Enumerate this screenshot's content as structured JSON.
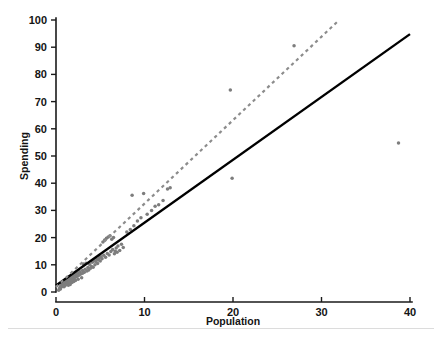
{
  "chart_data": {
    "type": "scatter",
    "title": "",
    "xlabel": "Population",
    "ylabel": "Spending",
    "xlim": [
      0,
      40
    ],
    "ylim": [
      0,
      100
    ],
    "xticks": [
      0,
      10,
      20,
      30,
      40
    ],
    "yticks": [
      0,
      10,
      20,
      30,
      40,
      50,
      60,
      70,
      80,
      90,
      100
    ],
    "grid": false,
    "legend": "none",
    "point_color": "#7d7d7d",
    "series": [
      {
        "name": "observations",
        "type": "scatter",
        "marker": "circle",
        "color": "#7d7d7d",
        "points": [
          [
            0.3,
            0.6
          ],
          [
            0.4,
            1.4
          ],
          [
            0.5,
            2.0
          ],
          [
            0.5,
            1.1
          ],
          [
            0.6,
            2.6
          ],
          [
            0.6,
            1.8
          ],
          [
            0.7,
            2.2
          ],
          [
            0.7,
            3.1
          ],
          [
            0.8,
            2.4
          ],
          [
            0.8,
            3.4
          ],
          [
            0.9,
            2.9
          ],
          [
            0.9,
            1.9
          ],
          [
            1.0,
            3.3
          ],
          [
            1.0,
            2.3
          ],
          [
            1.1,
            3.8
          ],
          [
            1.1,
            2.7
          ],
          [
            1.2,
            4.0
          ],
          [
            1.2,
            3.0
          ],
          [
            1.3,
            4.4
          ],
          [
            1.3,
            3.3
          ],
          [
            1.4,
            2.5
          ],
          [
            1.4,
            4.6
          ],
          [
            1.5,
            3.6
          ],
          [
            1.5,
            5.0
          ],
          [
            1.6,
            4.1
          ],
          [
            1.6,
            2.8
          ],
          [
            1.7,
            5.3
          ],
          [
            1.7,
            4.3
          ],
          [
            1.8,
            3.5
          ],
          [
            1.8,
            5.6
          ],
          [
            1.9,
            4.6
          ],
          [
            1.9,
            6.0
          ],
          [
            2.0,
            5.0
          ],
          [
            2.0,
            3.9
          ],
          [
            2.1,
            6.3
          ],
          [
            2.2,
            5.4
          ],
          [
            2.2,
            4.2
          ],
          [
            2.3,
            6.7
          ],
          [
            2.4,
            5.8
          ],
          [
            2.5,
            7.0
          ],
          [
            2.5,
            4.7
          ],
          [
            2.6,
            6.2
          ],
          [
            2.7,
            7.4
          ],
          [
            2.8,
            6.6
          ],
          [
            2.9,
            5.2
          ],
          [
            3.0,
            7.9
          ],
          [
            3.0,
            6.9
          ],
          [
            3.1,
            10.3
          ],
          [
            3.2,
            7.3
          ],
          [
            3.3,
            8.4
          ],
          [
            3.4,
            10.6
          ],
          [
            3.5,
            7.7
          ],
          [
            3.6,
            9.0
          ],
          [
            3.7,
            8.1
          ],
          [
            3.8,
            10.1
          ],
          [
            3.9,
            8.7
          ],
          [
            4.0,
            9.4
          ],
          [
            4.1,
            10.9
          ],
          [
            4.2,
            9.1
          ],
          [
            4.3,
            11.5
          ],
          [
            4.4,
            10.0
          ],
          [
            4.5,
            11.2
          ],
          [
            4.6,
            12.1
          ],
          [
            4.7,
            10.5
          ],
          [
            4.8,
            11.8
          ],
          [
            4.9,
            12.6
          ],
          [
            5.0,
            11.4
          ],
          [
            5.1,
            13.0
          ],
          [
            5.2,
            12.2
          ],
          [
            5.3,
            18.4
          ],
          [
            5.4,
            13.5
          ],
          [
            5.5,
            19.1
          ],
          [
            5.6,
            12.8
          ],
          [
            5.7,
            19.8
          ],
          [
            5.8,
            14.2
          ],
          [
            5.9,
            20.2
          ],
          [
            6.0,
            13.6
          ],
          [
            6.1,
            20.7
          ],
          [
            6.2,
            14.9
          ],
          [
            6.3,
            19.4
          ],
          [
            6.4,
            15.6
          ],
          [
            6.5,
            20.0
          ],
          [
            6.6,
            14.1
          ],
          [
            6.7,
            15.0
          ],
          [
            6.8,
            16.2
          ],
          [
            6.9,
            14.6
          ],
          [
            7.0,
            16.9
          ],
          [
            7.2,
            15.3
          ],
          [
            7.4,
            17.6
          ],
          [
            7.6,
            16.4
          ],
          [
            8.0,
            22.1
          ],
          [
            8.4,
            23.0
          ],
          [
            8.6,
            35.6
          ],
          [
            8.8,
            24.4
          ],
          [
            9.2,
            26.1
          ],
          [
            9.6,
            27.3
          ],
          [
            9.9,
            36.2
          ],
          [
            10.3,
            28.6
          ],
          [
            10.8,
            30.0
          ],
          [
            11.2,
            31.5
          ],
          [
            11.6,
            32.1
          ],
          [
            12.1,
            33.6
          ],
          [
            12.6,
            37.9
          ],
          [
            12.9,
            38.3
          ],
          [
            19.7,
            74.3
          ],
          [
            19.9,
            41.8
          ],
          [
            26.9,
            90.5
          ],
          [
            38.7,
            54.8
          ]
        ]
      },
      {
        "name": "solid-fit-line",
        "type": "line",
        "style": "solid",
        "color": "#000000",
        "endpoints": [
          [
            0.0,
            2.4
          ],
          [
            40.0,
            94.8
          ]
        ],
        "slope": 2.31,
        "intercept": 2.4
      },
      {
        "name": "dashed-fit-line",
        "type": "line",
        "style": "dashed",
        "color": "#8c8c8c",
        "endpoints": [
          [
            0.0,
            1.8
          ],
          [
            32.0,
            100.0
          ]
        ],
        "slope": 3.07,
        "intercept": 1.8
      }
    ]
  }
}
